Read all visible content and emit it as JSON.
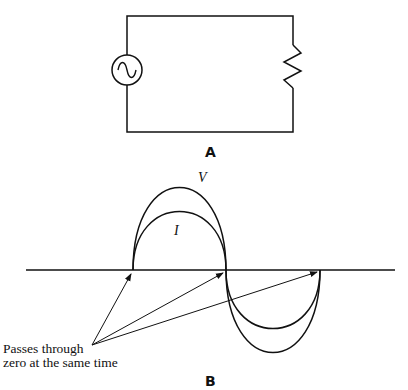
{
  "panel_a": {
    "label": "A",
    "components": [
      "ac-source",
      "resistor"
    ]
  },
  "panel_b": {
    "label": "B",
    "curves": [
      {
        "name": "V",
        "label": "V"
      },
      {
        "name": "I",
        "label": "I"
      }
    ],
    "annotation": {
      "line1": "Passes through",
      "line2": "zero at the same time"
    }
  },
  "colors": {
    "stroke": "#111111",
    "background": "#ffffff"
  }
}
